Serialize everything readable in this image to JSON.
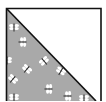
{
  "block": {
    "type": "half-square-triangle",
    "diagonal": "top-left to bottom-right",
    "colors": {
      "background": "#ffffff",
      "light_triangle": "#ffffff",
      "fabric": "#a9a9a9",
      "outline": "#111111",
      "motif_wing": "#ffffff",
      "motif_body": "#2a2a2a"
    },
    "motif": "dragonfly-print",
    "motifs": [
      {
        "x": 14,
        "y": 27,
        "r": 0
      },
      {
        "x": 23,
        "y": 42,
        "r": 90
      },
      {
        "x": 44,
        "y": 61,
        "r": -40
      },
      {
        "x": 27,
        "y": 69,
        "r": 40
      },
      {
        "x": 13,
        "y": 79,
        "r": 40
      },
      {
        "x": 61,
        "y": 71,
        "r": 30
      },
      {
        "x": 49,
        "y": 89,
        "r": 90
      },
      {
        "x": 14,
        "y": 97,
        "r": 0
      },
      {
        "x": 68,
        "y": 96,
        "r": 90
      },
      {
        "x": 84,
        "y": 98,
        "r": 0
      },
      {
        "x": 7,
        "y": 60,
        "r": 0
      }
    ]
  }
}
